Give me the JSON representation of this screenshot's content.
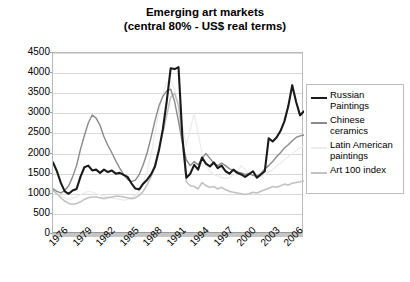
{
  "chart_data": {
    "type": "line",
    "title": "Emerging art markets",
    "subtitle": "(central 80% - US$ real terms)",
    "xlabel": "",
    "ylabel": "",
    "ylim": [
      0,
      4500
    ],
    "xlim": [
      1976,
      2008
    ],
    "grid": true,
    "legend_position": "right",
    "yticks": [
      4500,
      4000,
      3500,
      3000,
      2500,
      2000,
      1500,
      1000,
      500,
      0
    ],
    "xticks": [
      "1976",
      "1979",
      "1982",
      "1985",
      "1988",
      "1991",
      "1994",
      "1997",
      "2000",
      "2003",
      "2006"
    ],
    "x": [
      1976,
      1976.5,
      1977,
      1977.5,
      1978,
      1978.5,
      1979,
      1979.5,
      1980,
      1980.5,
      1981,
      1981.5,
      1982,
      1982.5,
      1983,
      1983.5,
      1984,
      1984.5,
      1985,
      1985.5,
      1986,
      1986.5,
      1987,
      1987.5,
      1988,
      1988.5,
      1989,
      1989.5,
      1990,
      1990.5,
      1991,
      1991.5,
      1992,
      1992.5,
      1993,
      1993.5,
      1994,
      1994.5,
      1995,
      1995.5,
      1996,
      1996.5,
      1997,
      1997.5,
      1998,
      1998.5,
      1999,
      1999.5,
      2000,
      2000.5,
      2001,
      2001.5,
      2002,
      2002.5,
      2003,
      2003.5,
      2004,
      2004.5,
      2005,
      2005.5,
      2006,
      2006.5,
      2007,
      2007.5,
      2008
    ],
    "series": [
      {
        "name": "Russian Paintings",
        "color": "#1a1a1a",
        "width": 2.1,
        "values": [
          1780,
          1560,
          1270,
          1060,
          1000,
          1080,
          1120,
          1420,
          1660,
          1700,
          1580,
          1600,
          1520,
          1600,
          1540,
          1580,
          1500,
          1520,
          1470,
          1420,
          1260,
          1130,
          1110,
          1250,
          1350,
          1480,
          1680,
          2080,
          2600,
          3300,
          4120,
          4100,
          4150,
          2400,
          1400,
          1500,
          1720,
          1600,
          1900,
          1750,
          1680,
          1780,
          1640,
          1700,
          1560,
          1500,
          1600,
          1520,
          1480,
          1420,
          1490,
          1560,
          1400,
          1480,
          1560,
          2380,
          2300,
          2400,
          2560,
          2800,
          3180,
          3700,
          3280,
          2950,
          3050
        ]
      },
      {
        "name": "Chinese ceramics",
        "color": "#8a8a8a",
        "width": 1.4,
        "values": [
          1120,
          1060,
          1020,
          1080,
          1200,
          1420,
          1700,
          2100,
          2450,
          2760,
          2960,
          2880,
          2700,
          2420,
          2200,
          2020,
          1820,
          1640,
          1480,
          1360,
          1300,
          1340,
          1480,
          1720,
          2020,
          2400,
          2820,
          3180,
          3420,
          3560,
          3600,
          3300,
          2800,
          2260,
          1840,
          1700,
          1800,
          1720,
          1880,
          2000,
          1880,
          1760,
          1700,
          1760,
          1700,
          1620,
          1580,
          1540,
          1520,
          1480,
          1500,
          1460,
          1440,
          1500,
          1620,
          1700,
          1800,
          1920,
          2020,
          2140,
          2220,
          2320,
          2400,
          2440,
          2460
        ]
      },
      {
        "name": "Latin American paintings",
        "color": "#ececec",
        "width": 1.3,
        "values": [
          1080,
          1000,
          940,
          900,
          860,
          880,
          920,
          980,
          1020,
          1060,
          1040,
          1000,
          980,
          940,
          920,
          900,
          880,
          860,
          840,
          860,
          900,
          960,
          1080,
          1280,
          1560,
          1960,
          2500,
          3050,
          3500,
          3760,
          3800,
          3600,
          3200,
          2700,
          2200,
          2600,
          3000,
          2500,
          2000,
          1700,
          1560,
          1480,
          1440,
          1400,
          1380,
          1400,
          1460,
          1560,
          1700,
          1600,
          1500,
          1440,
          1400,
          1420,
          1480,
          1540,
          1600,
          1680,
          1760,
          1840,
          1920,
          2000,
          2080,
          2140,
          2200
        ]
      },
      {
        "name": "Art 100 index",
        "color": "#c2c2c2",
        "width": 1.6,
        "values": [
          1080,
          1000,
          900,
          820,
          760,
          740,
          760,
          800,
          860,
          900,
          920,
          920,
          900,
          880,
          900,
          920,
          940,
          940,
          920,
          900,
          880,
          900,
          960,
          1060,
          1220,
          1420,
          1720,
          2080,
          2500,
          2950,
          3400,
          3500,
          3200,
          2300,
          1300,
          1200,
          1180,
          1120,
          1280,
          1200,
          1160,
          1180,
          1120,
          1160,
          1100,
          1060,
          1040,
          1020,
          1000,
          980,
          1000,
          1040,
          1020,
          1060,
          1100,
          1140,
          1180,
          1160,
          1200,
          1240,
          1220,
          1260,
          1280,
          1300,
          1320
        ]
      }
    ]
  },
  "legend": {
    "items": [
      {
        "label": "Russian\nPaintings",
        "color": "#1a1a1a"
      },
      {
        "label": "Chinese\nceramics",
        "color": "#8a8a8a"
      },
      {
        "label": "Latin American\npaintings",
        "color": "#ececec"
      },
      {
        "label": "Art 100 index",
        "color": "#c2c2c2"
      }
    ]
  }
}
